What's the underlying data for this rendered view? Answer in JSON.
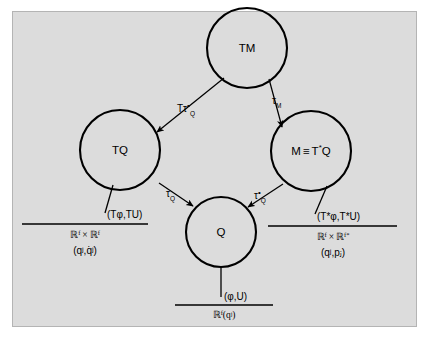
{
  "figure": {
    "background_color": "#ffffff",
    "panel_color": "#dcdcdc",
    "panel_border_color": "#b4b4b4",
    "ink_color": "#000000"
  },
  "nodes": [
    {
      "id": "TM",
      "label": "TM"
    },
    {
      "id": "TQ",
      "label": "TQ"
    },
    {
      "id": "M",
      "label_prefix": "M",
      "label_equiv": "≡",
      "label_suffix": "T",
      "label_star": "*",
      "label_tail": "Q",
      "label_full": "M ≡ T*Q"
    },
    {
      "id": "Q",
      "label": "Q"
    }
  ],
  "edges": [
    {
      "id": "TM-to-TQ",
      "from": "TM",
      "to": "TQ",
      "label_base": "Tτ",
      "label_star": "•",
      "label_sub": "Q",
      "label_full": "Tτ*Q"
    },
    {
      "id": "TM-to-M",
      "from": "TM",
      "to": "M",
      "label_base": "τ",
      "label_star": "",
      "label_sub": "M",
      "label_full": "τM"
    },
    {
      "id": "TQ-to-Q",
      "from": "TQ",
      "to": "Q",
      "label_base": "τ",
      "label_star": "",
      "label_sub": "Q",
      "label_full": "τQ"
    },
    {
      "id": "M-to-Q",
      "from": "M",
      "to": "Q",
      "label_base": "τ",
      "label_star": "•",
      "label_sub": "Q",
      "label_full": "τ*Q"
    }
  ],
  "charts": [
    {
      "id": "chart-TQ",
      "attached_to": "TQ",
      "map_label": "(Tφ,TU)",
      "space_first": "ℝ",
      "space_first_sup": "f",
      "space_times": "×",
      "space_second": "ℝ",
      "space_second_sup": "f",
      "space_full": "ℝᶠ × ℝᶠ",
      "coords": "(qʲ,q̇ʲ)",
      "coord_first": "q",
      "coord_first_sup": "j",
      "coord_second": "q̇",
      "coord_second_sup": "j"
    },
    {
      "id": "chart-M",
      "attached_to": "M",
      "map_label": "(T*φ,T*U)",
      "space_first": "ℝ",
      "space_first_sup": "f",
      "space_times": "×",
      "space_second": "ℝ",
      "space_second_sup": "f*",
      "space_full": "ℝᶠ × ℝᶠ*",
      "coords": "(qʲ,pⱼ)",
      "coord_first": "q",
      "coord_first_sup": "j",
      "coord_second": "p",
      "coord_second_sub": "j"
    },
    {
      "id": "chart-Q",
      "attached_to": "Q",
      "map_label": "(φ,U)",
      "space_first": "ℝ",
      "space_first_sup": "f",
      "space_full": "ℝᶠ(qʲ)",
      "coords": "(qʲ)",
      "coord_first": "q",
      "coord_first_sup": "j"
    }
  ]
}
